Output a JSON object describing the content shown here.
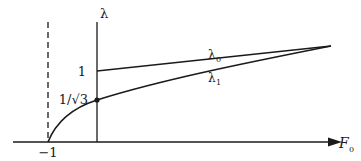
{
  "diagram": {
    "y_axis_label": "λ",
    "x_axis_label": "F",
    "x_axis_label_sub": "0",
    "tick_one": "1",
    "tick_inv_sqrt3": "1/√3",
    "tick_minus_one": "−1",
    "curve_upper_label": "λ",
    "curve_upper_sub": "0",
    "curve_lower_label": "λ",
    "curve_lower_sub": "1",
    "colors": {
      "ink": "#1a1a1a",
      "background": "#ffffff"
    }
  }
}
